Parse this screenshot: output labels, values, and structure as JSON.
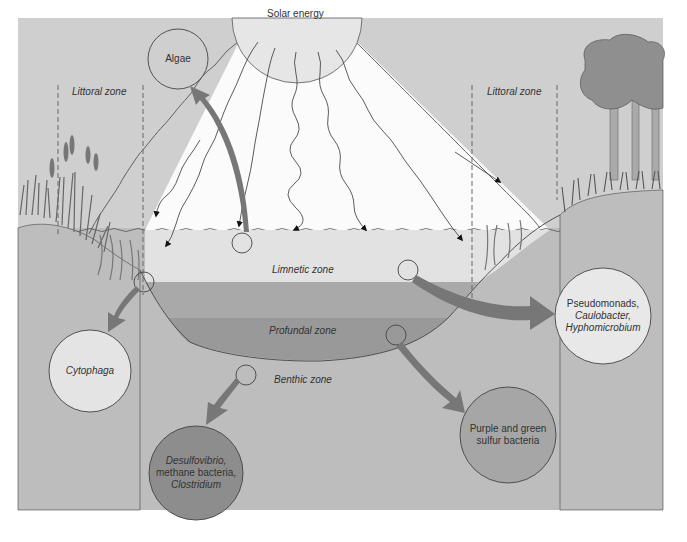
{
  "diagram": {
    "type": "lake-ecosystem-zones",
    "colors": {
      "background_sky": "#cfcfcf",
      "ground": "#bdbdbd",
      "light_wedge": "#fbfbfb",
      "limnetic": "#e2e2e2",
      "profundal": "#a9a9a9",
      "benthic": "#999999",
      "arrow": "#777777",
      "outline": "#444444"
    },
    "sun": {
      "label": "Solar energy"
    },
    "zones": {
      "littoral_left": "Littoral zone",
      "littoral_right": "Littoral zone",
      "limnetic": "Limnetic zone",
      "profundal": "Profundal zone",
      "benthic": "Benthic zone"
    },
    "organisms": {
      "algae": {
        "lines": [
          "Algae"
        ]
      },
      "cytophaga": {
        "lines": [
          "Cytophaga"
        ]
      },
      "pseudomonads": {
        "lines": [
          "Pseudomonads,",
          "Caulobacter,",
          "Hyphomicrobium"
        ]
      },
      "purple_green": {
        "lines": [
          "Purple and green",
          "sulfur bacteria"
        ]
      },
      "desulfovibrio": {
        "lines": [
          "Desulfovibrio,",
          "methane bacteria,",
          "Clostridium"
        ]
      }
    }
  }
}
